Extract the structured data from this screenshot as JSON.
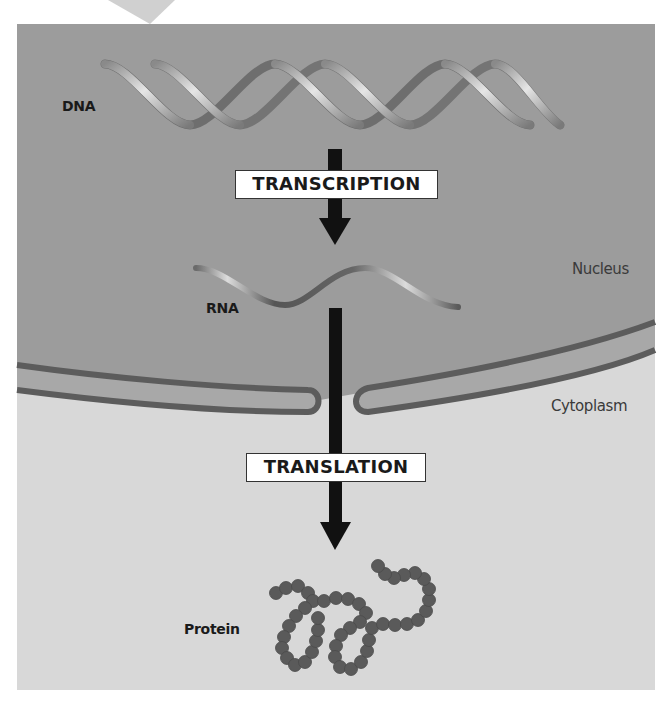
{
  "diagram": {
    "labels": {
      "dna": "DNA",
      "rna": "RNA",
      "protein": "Protein",
      "nucleus": "Nucleus",
      "cytoplasm": "Cytoplasm"
    },
    "processes": {
      "transcription": "TRANSCRIPTION",
      "translation": "TRANSLATION"
    },
    "colors": {
      "nucleus_fill": "#9c9c9c",
      "cytoplasm_fill": "#d8d8d8",
      "membrane": "#5c5c5c",
      "arrow": "#111111",
      "protein_bead": "#5a5a5a",
      "dna_strand_light": "#c9c9c9",
      "dna_strand_dark": "#6e6e6e"
    },
    "flow": [
      "DNA",
      "TRANSCRIPTION",
      "RNA",
      "TRANSLATION",
      "Protein"
    ]
  }
}
